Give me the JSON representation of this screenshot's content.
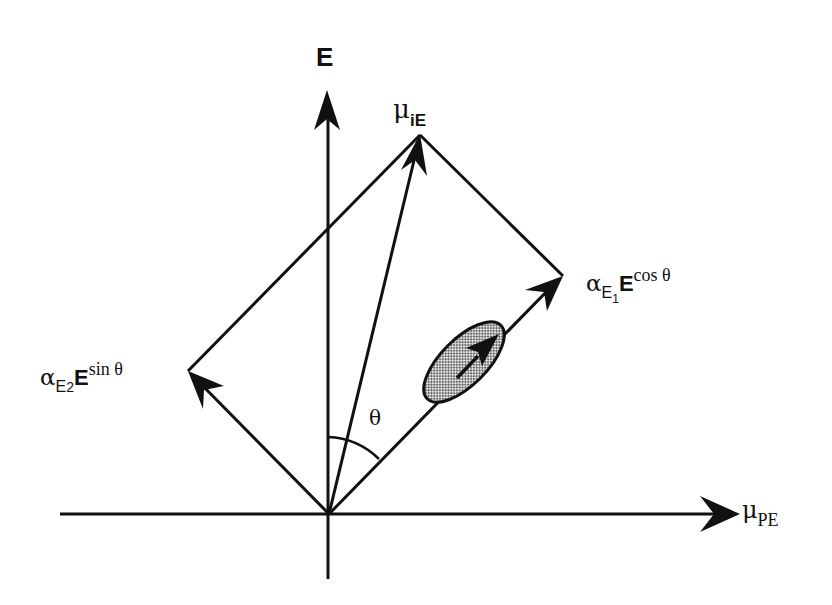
{
  "diagram": {
    "axes": {
      "vertical": {
        "label": "E"
      },
      "horizontal": {
        "symbol": "μ",
        "subscript": "PE"
      }
    },
    "vectors": {
      "resultant": {
        "symbol": "μ",
        "subscript": "iE"
      },
      "component_1": {
        "alpha": "α",
        "alpha_sub": "E",
        "alpha_sub_index": "1",
        "field": "E",
        "func": "cos θ"
      },
      "component_2": {
        "alpha": "α",
        "alpha_sub": "E",
        "alpha_sub_index": "2",
        "field": "E",
        "func": "sin θ"
      }
    },
    "angle": {
      "label": "θ"
    },
    "molecule": {
      "shape": "ellipse",
      "fill": "stippled",
      "dipole_arrow": true
    },
    "colors": {
      "stroke": "#111111",
      "fill": "#bdbdbd",
      "background": "#ffffff"
    }
  }
}
